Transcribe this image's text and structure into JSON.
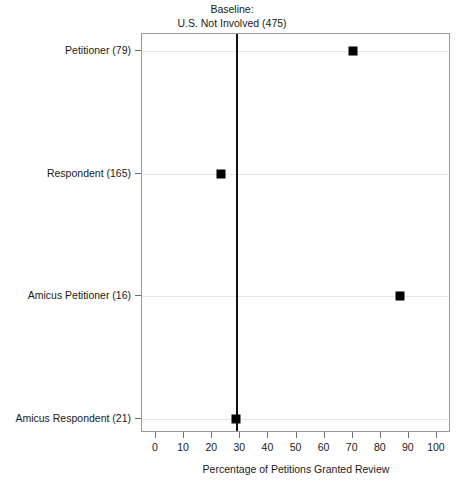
{
  "chart_data": {
    "type": "scatter",
    "title": "",
    "annotations": [
      {
        "name": "baseline-label",
        "line1": "Baseline:",
        "line2": "U.S. Not Involved (475)",
        "value": 28.5
      }
    ],
    "categories": [
      "Petitioner (79)",
      "Respondent (165)",
      "Amicus Petitioner (16)",
      "Amicus Respondent (21)"
    ],
    "values": [
      70,
      23,
      87,
      28.5
    ],
    "points": [
      {
        "label": "Petitioner (79)",
        "value": 70
      },
      {
        "label": "Respondent (165)",
        "value": 23
      },
      {
        "label": "Amicus Petitioner (16)",
        "value": 87
      },
      {
        "label": "Amicus Respondent (21)",
        "value": 28.5
      }
    ],
    "xlabel": "Percentage of Petitions Granted Review",
    "ylabel": "",
    "xlim": [
      -5,
      105
    ],
    "xticks": [
      0,
      10,
      20,
      30,
      40,
      50,
      60,
      70,
      80,
      90,
      100
    ],
    "xticklabels": [
      "0",
      "10",
      "20",
      "30",
      "40",
      "50",
      "60",
      "70",
      "80",
      "90",
      "100"
    ],
    "grid": true,
    "grid_axis": "y",
    "legend": "none",
    "marker_color": "#000000",
    "baseline_color": "#111111",
    "grid_color": "#e8e8e8",
    "frame_color": "#9a9a9a"
  }
}
